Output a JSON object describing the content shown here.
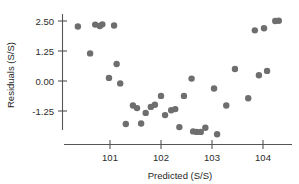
{
  "chart_data": {
    "type": "scatter",
    "title": "",
    "xlabel": "Predicted (S/S)",
    "ylabel": "Residuals (S/S)",
    "xlim": [
      100.25,
      104.55
    ],
    "ylim": [
      -2.45,
      2.95
    ],
    "xticks": [
      101,
      102,
      103,
      104
    ],
    "xtick_labels": [
      "101",
      "102",
      "103",
      "104"
    ],
    "yticks": [
      2.5,
      1.25,
      0.0,
      -1.25
    ],
    "ytick_labels": [
      "2.50",
      "1.25",
      "0.00",
      "-1.25"
    ],
    "grid": false,
    "legend": null,
    "marker": "circle",
    "marker_color": "#6e6e6e",
    "marker_size": 3.2,
    "n_points": 44,
    "points": [
      {
        "x": 100.37,
        "y": 2.27
      },
      {
        "x": 100.61,
        "y": 1.15
      },
      {
        "x": 100.71,
        "y": 2.35
      },
      {
        "x": 100.8,
        "y": 2.29
      },
      {
        "x": 100.85,
        "y": 2.36
      },
      {
        "x": 100.98,
        "y": 0.13
      },
      {
        "x": 101.08,
        "y": 2.31
      },
      {
        "x": 101.13,
        "y": 0.71
      },
      {
        "x": 101.2,
        "y": -0.1
      },
      {
        "x": 101.31,
        "y": -1.79
      },
      {
        "x": 101.45,
        "y": -1.02
      },
      {
        "x": 101.53,
        "y": -1.13
      },
      {
        "x": 101.61,
        "y": -1.77
      },
      {
        "x": 101.7,
        "y": -1.33
      },
      {
        "x": 101.8,
        "y": -1.08
      },
      {
        "x": 101.88,
        "y": -0.99
      },
      {
        "x": 102.0,
        "y": -0.62
      },
      {
        "x": 102.08,
        "y": -1.42
      },
      {
        "x": 102.2,
        "y": -1.22
      },
      {
        "x": 102.28,
        "y": -1.17
      },
      {
        "x": 102.36,
        "y": -1.92
      },
      {
        "x": 102.45,
        "y": -0.62
      },
      {
        "x": 102.6,
        "y": 0.1
      },
      {
        "x": 102.63,
        "y": -2.1
      },
      {
        "x": 102.7,
        "y": -2.12
      },
      {
        "x": 102.78,
        "y": -2.12
      },
      {
        "x": 102.87,
        "y": -1.95
      },
      {
        "x": 103.04,
        "y": -0.31
      },
      {
        "x": 103.1,
        "y": -2.22
      },
      {
        "x": 103.28,
        "y": -1.02
      },
      {
        "x": 103.45,
        "y": 0.5
      },
      {
        "x": 103.71,
        "y": -0.72
      },
      {
        "x": 103.84,
        "y": 2.11
      },
      {
        "x": 103.92,
        "y": 0.24
      },
      {
        "x": 104.02,
        "y": 2.2
      },
      {
        "x": 104.08,
        "y": 0.42
      },
      {
        "x": 104.24,
        "y": 2.5
      },
      {
        "x": 104.31,
        "y": 2.51
      }
    ]
  }
}
